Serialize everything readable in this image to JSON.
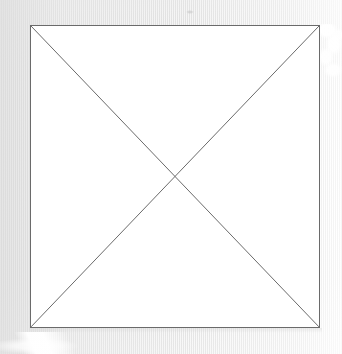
{
  "canvas": {
    "width": 342,
    "height": 354,
    "background_color": "#e9e9e9",
    "description": "Scanned light-gray pinstriped paper background"
  },
  "placeholder": {
    "kind": "broken-image-placeholder",
    "label": "Missing image placeholder",
    "shape": "rectangle-with-crossed-diagonals",
    "fill_color": "#ffffff",
    "stroke_color": "#6a6a6a",
    "stroke_width": 1,
    "x": 30,
    "y": 25,
    "width": 290,
    "height": 303,
    "center_x": 175,
    "center_y": 177,
    "diagonals": [
      {
        "name": "diagonal-top-left-to-bottom-right",
        "x1": 0,
        "y1": 0,
        "x2": 290,
        "y2": 303
      },
      {
        "name": "diagonal-top-right-to-bottom-left",
        "x1": 290,
        "y1": 0,
        "x2": 0,
        "y2": 303
      }
    ]
  },
  "artifacts": [
    {
      "name": "right-blob",
      "label": "White scan blob right of top-right corner",
      "color": "#ffffff"
    },
    {
      "name": "bottom-streak",
      "label": "White diagonal scan streak at lower left",
      "color": "#ffffff"
    },
    {
      "name": "bottom-glow",
      "label": "Soft white glow along bottom edge",
      "color": "#ffffff"
    },
    {
      "name": "top-speck",
      "label": "Faint gray speck near top edge",
      "color": "#c4c4c4"
    }
  ]
}
